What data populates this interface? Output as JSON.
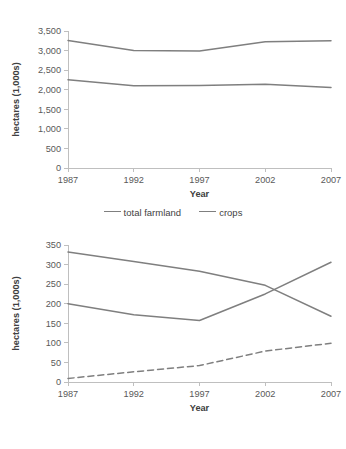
{
  "chart_data": [
    {
      "id": "chart-top",
      "type": "line",
      "title": "",
      "xlabel": "Year",
      "ylabel": "hectares (1,000s)",
      "x": [
        1987,
        1992,
        1997,
        2002,
        2007
      ],
      "categories": [
        "1987",
        "1992",
        "1997",
        "2002",
        "2007"
      ],
      "xticklabels": [
        "1987",
        "1992",
        "1997",
        "2002",
        "2007"
      ],
      "yticklabels": [
        "0",
        "500",
        "1,000",
        "1,500",
        "2,000",
        "2,500",
        "3,000",
        "3,500"
      ],
      "yticks": [
        0,
        500,
        1000,
        1500,
        2000,
        2500,
        3000,
        3500
      ],
      "ylim": [
        0,
        3500
      ],
      "grid": false,
      "legend_position": "bottom",
      "series": [
        {
          "name": "total farmland",
          "style": "solid",
          "color": "#7f7f7f",
          "values": [
            3260,
            3000,
            2990,
            3225,
            3250
          ]
        },
        {
          "name": "crops",
          "style": "solid",
          "color": "#7f7f7f",
          "values": [
            2255,
            2100,
            2110,
            2140,
            2055
          ]
        }
      ]
    },
    {
      "id": "chart-bottom",
      "type": "line",
      "title": "",
      "xlabel": "Year",
      "ylabel": "hectares (1,000s)",
      "x": [
        1987,
        1992,
        1997,
        2002,
        2007
      ],
      "categories": [
        "1987",
        "1992",
        "1997",
        "2002",
        "2007"
      ],
      "xticklabels": [
        "1987",
        "1992",
        "1997",
        "2002",
        "2007"
      ],
      "yticklabels": [
        "0",
        "50",
        "100",
        "150",
        "200",
        "250",
        "300",
        "350"
      ],
      "yticks": [
        0,
        50,
        100,
        150,
        200,
        250,
        300,
        350
      ],
      "ylim": [
        0,
        350
      ],
      "grid": false,
      "legend_position": "bottom",
      "series": [
        {
          "name": "grazed crops",
          "style": "solid",
          "color": "#7f7f7f",
          "values": [
            332,
            308,
            283,
            247,
            168
          ]
        },
        {
          "name": "permanent pasture",
          "style": "solid",
          "color": "#7f7f7f",
          "values": [
            200,
            172,
            157,
            225,
            306
          ]
        },
        {
          "name": "conservation cover",
          "style": "dashed",
          "color": "#7f7f7f",
          "values": [
            9,
            26,
            42,
            79,
            99
          ]
        }
      ]
    }
  ],
  "charts": {
    "top": {
      "ylabel": "hectares (1,000s)",
      "xlabel": "Year",
      "yticks": [
        "3,500",
        "3,000",
        "2,500",
        "2,000",
        "1,500",
        "1,000",
        "500",
        "0"
      ],
      "xticks": [
        "1987",
        "1992",
        "1997",
        "2002",
        "2007"
      ],
      "legend": [
        {
          "label": "total farmland",
          "style": "solid"
        },
        {
          "label": "crops",
          "style": "solid"
        }
      ]
    },
    "bottom": {
      "ylabel": "hectares (1,000s)",
      "xlabel": "Year",
      "yticks": [
        "350",
        "300",
        "250",
        "200",
        "150",
        "100",
        "50",
        "0"
      ],
      "xticks": [
        "1987",
        "1992",
        "1997",
        "2002",
        "2007"
      ],
      "legend": [
        {
          "label": "grazed crops",
          "style": "solid"
        },
        {
          "label": "permanent pasture",
          "style": "solid"
        },
        {
          "label": "conservation cover",
          "style": "dashed"
        }
      ]
    }
  },
  "colors": {
    "line": "#7f7f7f",
    "axis": "#bfbfbf",
    "text": "#595959",
    "background": "#ffffff"
  }
}
